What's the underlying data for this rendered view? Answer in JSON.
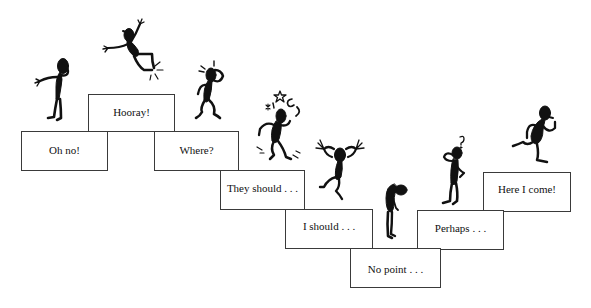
{
  "diagram": {
    "type": "staircase",
    "ink_color": "#111111",
    "border_color": "#3a3a3a",
    "steps": [
      {
        "id": "oh-no",
        "label": "Oh no!",
        "order": 1,
        "figure": "head-in-hand"
      },
      {
        "id": "hooray",
        "label": "Hooray!",
        "order": 2,
        "figure": "leaping-joy"
      },
      {
        "id": "where",
        "label": "Where?",
        "order": 3,
        "figure": "confused-scratching-head"
      },
      {
        "id": "they-should",
        "label": "They should . . .",
        "order": 4,
        "figure": "dizzy-stars"
      },
      {
        "id": "i-should",
        "label": "I should . . .",
        "order": 5,
        "figure": "tearing-hair"
      },
      {
        "id": "no-point",
        "label": "No point . . .",
        "order": 6,
        "figure": "slumped-despair"
      },
      {
        "id": "perhaps",
        "label": "Perhaps . . .",
        "order": 7,
        "figure": "pondering-question"
      },
      {
        "id": "here-i-come",
        "label": "Here I come!",
        "order": 8,
        "figure": "running-forward"
      }
    ]
  }
}
